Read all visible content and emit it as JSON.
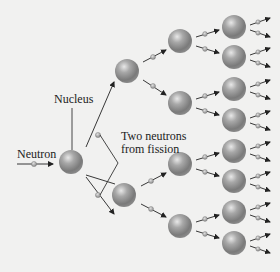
{
  "diagram": {
    "type": "nuclear chain reaction",
    "labels": {
      "neutron": "Neutron",
      "nucleus": "Nucleus",
      "fission_line1": "Two neutrons",
      "fission_line2": "from fission"
    },
    "colors": {
      "background": "#f1f1f0",
      "nucleus_fill": "#8e8e8e",
      "nucleus_highlight": "#e6e6e6",
      "neutron_fill": "#b0b0b0",
      "arrow": "#222222"
    },
    "generations": [
      {
        "name": "initial",
        "count": 1
      },
      {
        "name": "generation-1",
        "count": 2
      },
      {
        "name": "generation-2",
        "count": 4
      },
      {
        "name": "generation-3",
        "count": 8
      }
    ]
  }
}
